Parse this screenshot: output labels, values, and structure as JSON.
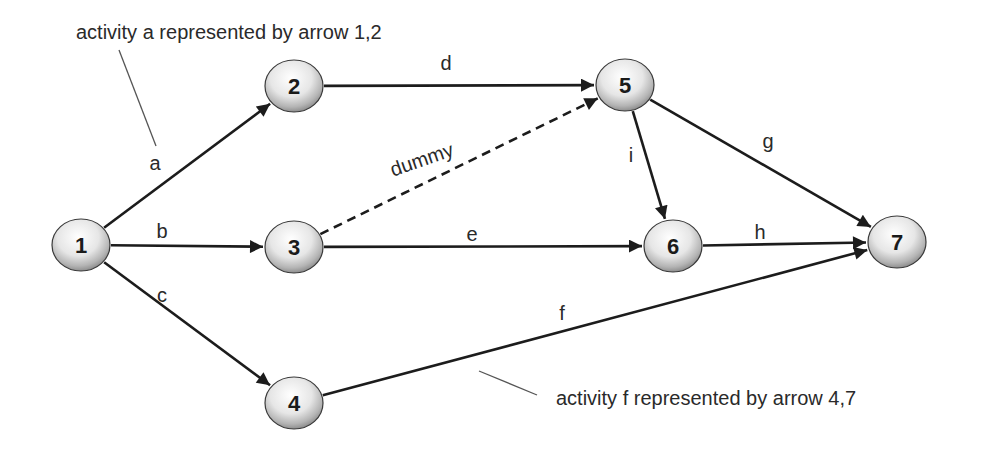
{
  "nodes": [
    {
      "id": "1",
      "label": "1"
    },
    {
      "id": "2",
      "label": "2"
    },
    {
      "id": "3",
      "label": "3"
    },
    {
      "id": "4",
      "label": "4"
    },
    {
      "id": "5",
      "label": "5"
    },
    {
      "id": "6",
      "label": "6"
    },
    {
      "id": "7",
      "label": "7"
    }
  ],
  "edges": [
    {
      "id": "a",
      "label": "a",
      "from": "1",
      "to": "2",
      "style": "solid"
    },
    {
      "id": "b",
      "label": "b",
      "from": "1",
      "to": "3",
      "style": "solid"
    },
    {
      "id": "c",
      "label": "c",
      "from": "1",
      "to": "4",
      "style": "solid"
    },
    {
      "id": "d",
      "label": "d",
      "from": "2",
      "to": "5",
      "style": "solid"
    },
    {
      "id": "dummy",
      "label": "dummy",
      "from": "3",
      "to": "5",
      "style": "dashed"
    },
    {
      "id": "e",
      "label": "e",
      "from": "3",
      "to": "6",
      "style": "solid"
    },
    {
      "id": "f",
      "label": "f",
      "from": "4",
      "to": "7",
      "style": "solid"
    },
    {
      "id": "g",
      "label": "g",
      "from": "5",
      "to": "7",
      "style": "solid"
    },
    {
      "id": "i",
      "label": "i",
      "from": "5",
      "to": "6",
      "style": "solid"
    },
    {
      "id": "h",
      "label": "h",
      "from": "6",
      "to": "7",
      "style": "solid"
    }
  ],
  "annotations": [
    {
      "id": "annotation-a",
      "text": "activity a represented by arrow 1,2",
      "refers_to": "a"
    },
    {
      "id": "annotation-f",
      "text": "activity f represented by arrow 4,7",
      "refers_to": "f"
    }
  ],
  "colors": {
    "line": "#1c1c1c",
    "node_highlight": "#ffffff",
    "node_shadow": "#9a9a9a",
    "text": "#2a2a2a"
  }
}
